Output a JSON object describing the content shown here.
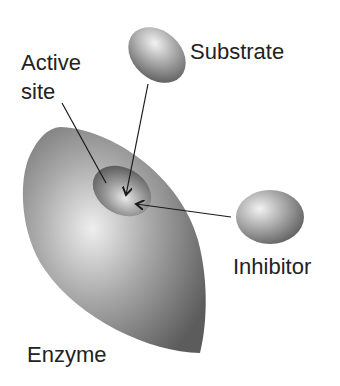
{
  "diagram": {
    "type": "enzyme competitive inhibition",
    "labels": {
      "substrate": "Substrate",
      "active_site_line1": "Active",
      "active_site_line2": "site",
      "inhibitor": "Inhibitor",
      "enzyme": "Enzyme"
    },
    "colors": {
      "shape_dark": "#5a5a5a",
      "shape_mid": "#8c8c8c",
      "shape_light": "#e6e6e6",
      "arrow": "#1a1a1a",
      "text": "#222222"
    }
  }
}
